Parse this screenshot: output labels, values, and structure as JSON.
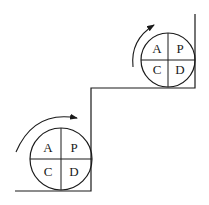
{
  "diagram": {
    "stroke_color": "#1a1a1a",
    "lower_cycle": {
      "quadrants": {
        "top_left": "A",
        "top_right": "P",
        "bottom_left": "C",
        "bottom_right": "D"
      },
      "rotation": "clockwise"
    },
    "upper_cycle": {
      "quadrants": {
        "top_left": "A",
        "top_right": "P",
        "bottom_left": "C",
        "bottom_right": "D"
      },
      "rotation": "clockwise"
    }
  }
}
